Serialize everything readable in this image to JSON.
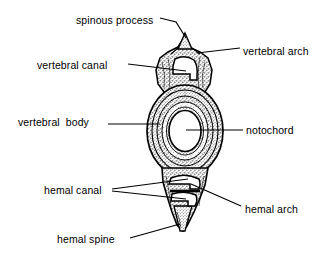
{
  "figure": {
    "background_color": "#ffffff",
    "ink_color": "#000000",
    "type": "anatomical-line-drawing"
  },
  "labels": [
    {
      "id": "spinous-process",
      "text": "spinous process",
      "side": "left",
      "x": 76,
      "y": 14,
      "leader": "polyline",
      "target": "top spike tip"
    },
    {
      "id": "vertebral-arch",
      "text": "vertebral arch",
      "side": "right",
      "x": 243,
      "y": 45,
      "leader": "line",
      "target": "right arch shoulder"
    },
    {
      "id": "vertebral-canal",
      "text": "vertebral canal",
      "side": "left",
      "x": 37,
      "y": 59,
      "leader": "line",
      "target": "neural canal opening"
    },
    {
      "id": "vertebral-body",
      "text": "vertebral  body",
      "side": "left",
      "x": 18,
      "y": 116,
      "leader": "line",
      "target": "centrum rings"
    },
    {
      "id": "notochord",
      "text": "notochord",
      "side": "right",
      "x": 246,
      "y": 124,
      "leader": "line",
      "target": "central white circle"
    },
    {
      "id": "hemal-canal",
      "text": "hemal canal",
      "side": "left",
      "x": 44,
      "y": 184,
      "leader": "forked",
      "target": "two hemal openings"
    },
    {
      "id": "hemal-arch",
      "text": "hemal arch",
      "side": "right",
      "x": 245,
      "y": 203,
      "leader": "line",
      "target": "hemal arch wall"
    },
    {
      "id": "hemal-spine",
      "text": "hemal spine",
      "side": "left",
      "x": 57,
      "y": 233,
      "leader": "line",
      "target": "bottom tapered spine"
    }
  ],
  "structures": [
    {
      "id": "spinous-process-spike",
      "name": "spinous process"
    },
    {
      "id": "vertebral-arch-mass",
      "name": "vertebral arch"
    },
    {
      "id": "vertebral-canal-void",
      "name": "vertebral canal"
    },
    {
      "id": "vertebral-body-rings",
      "name": "vertebral body"
    },
    {
      "id": "notochord-void",
      "name": "notochord"
    },
    {
      "id": "hemal-canal-upper",
      "name": "hemal canal (upper)"
    },
    {
      "id": "hemal-canal-lower",
      "name": "hemal canal (lower)"
    },
    {
      "id": "hemal-arch-mass",
      "name": "hemal arch"
    },
    {
      "id": "hemal-spine-taper",
      "name": "hemal spine"
    }
  ]
}
